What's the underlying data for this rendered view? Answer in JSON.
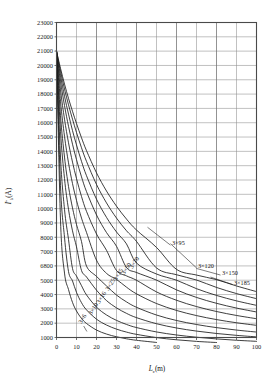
{
  "chart_data": {
    "type": "line",
    "title": "",
    "xlabel": "Lc(m)",
    "xlabel_main": "L",
    "xlabel_sub": "c",
    "xlabel_unit": "(m)",
    "ylabel": "I''k(A)",
    "ylabel_main": "I",
    "ylabel_sub": "k",
    "ylabel_sup": "''",
    "ylabel_unit": "(A)",
    "xlim": [
      0,
      100
    ],
    "ylim": [
      1000,
      23000
    ],
    "grid": true,
    "legend_position": "inline-annotations",
    "xticks": [
      0,
      10,
      20,
      30,
      40,
      50,
      60,
      70,
      80,
      90,
      100
    ],
    "xtick_labels": [
      "0",
      "10",
      "20",
      "30",
      "40",
      "50",
      "60",
      "70",
      "80",
      "90",
      "100"
    ],
    "yticks": [
      1000,
      2000,
      3000,
      4000,
      5000,
      6800,
      7000,
      8000,
      9000,
      10000,
      11000,
      12000,
      13000,
      14000,
      15000,
      16000,
      17000,
      18000,
      19000,
      20000,
      21000,
      22000,
      23000
    ],
    "ytick_labels": [
      "1000",
      "2000",
      "3000",
      "4000",
      "5000",
      "6800",
      "7000",
      "8000",
      "9000",
      "10000",
      "11000",
      "12000",
      "13000",
      "14000",
      "15000",
      "16000",
      "17000",
      "18000",
      "19000",
      "20000",
      "21000",
      "22000",
      "23000"
    ],
    "x": [
      0,
      2,
      4,
      6,
      8,
      10,
      12.5,
      15,
      20,
      25,
      30,
      35,
      40,
      50,
      60,
      70,
      80,
      90,
      100
    ],
    "series": [
      {
        "name": "3×6",
        "label": "3×6",
        "label_x": 12.5,
        "label_y": 1950,
        "label_rotate": -58,
        "values": [
          21000,
          9200,
          5900,
          4350,
          3450,
          2850,
          2330,
          1980,
          1520,
          1240,
          1050,
          910,
          805,
          655,
          552,
          478,
          421,
          377,
          341
        ]
      },
      {
        "name": "3×10",
        "label": "3×10",
        "label_x": 17.5,
        "label_y": 2550,
        "label_rotate": -58,
        "values": [
          21000,
          11600,
          8000,
          6100,
          4950,
          4150,
          3430,
          2930,
          2280,
          1870,
          1585,
          1378,
          1220,
          995,
          840,
          728,
          642,
          575,
          520
        ]
      },
      {
        "name": "3×16",
        "label": "3×16",
        "label_x": 21.5,
        "label_y": 3350,
        "label_rotate": -58,
        "values": [
          21000,
          13600,
          9950,
          7850,
          6480,
          5520,
          4620,
          3975,
          3120,
          2575,
          2195,
          1912,
          1695,
          1388,
          1175,
          1020,
          901,
          808,
          732
        ]
      },
      {
        "name": "3×25",
        "label": "3×25",
        "label_x": 26,
        "label_y": 4250,
        "label_rotate": -58,
        "values": [
          21000,
          15400,
          12100,
          9950,
          8450,
          7330,
          6230,
          5415,
          4305,
          3580,
          3070,
          2685,
          2387,
          1962,
          1665,
          1448,
          1281,
          1150,
          1043
        ]
      },
      {
        "name": "3×35",
        "label": "3×35",
        "label_x": 30,
        "label_y": 4950,
        "label_rotate": -58,
        "values": [
          21000,
          16500,
          13600,
          11550,
          10050,
          8890,
          7700,
          6775,
          5480,
          4600,
          3965,
          3487,
          3110,
          2569,
          2188,
          1907,
          1691,
          1519,
          1380
        ]
      },
      {
        "name": "3×50",
        "label": "3×50",
        "label_x": 34,
        "label_y": 5650,
        "label_rotate": -58,
        "values": [
          21000,
          17500,
          15050,
          13200,
          11750,
          10580,
          9340,
          8340,
          6880,
          5860,
          5100,
          4515,
          4050,
          3372,
          2890,
          2530,
          2252,
          2030,
          1849
        ]
      },
      {
        "name": "3×70",
        "label": "3×70",
        "label_x": 38,
        "label_y": 6400,
        "label_rotate": -58,
        "values": [
          21000,
          18300,
          16250,
          14600,
          13250,
          12100,
          10850,
          9810,
          8230,
          7090,
          6225,
          5545,
          4998,
          4185,
          3601,
          3160,
          2815,
          2539,
          2313
        ]
      },
      {
        "name": "3×95",
        "label": "3×95",
        "label_x": 57,
        "label_y": 7450,
        "label_rotate": 0,
        "values": [
          21000,
          18900,
          17200,
          15750,
          14500,
          13420,
          12220,
          11190,
          9560,
          8330,
          7370,
          6600,
          5970,
          5015,
          4325,
          3800,
          3388,
          3056,
          2783
        ]
      },
      {
        "name": "3×120",
        "label": "3×120",
        "label_x": 70,
        "label_y": 6550,
        "label_rotate": 0,
        "values": [
          21000,
          19300,
          17850,
          16600,
          15450,
          14450,
          13300,
          12300,
          10660,
          9390,
          8370,
          7535,
          6840,
          5780,
          5005,
          4410,
          3939,
          3558,
          3244
        ]
      },
      {
        "name": "3×150",
        "label": "3×150",
        "label_x": 82,
        "label_y": 5650,
        "label_rotate": 0,
        "values": [
          21000,
          19600,
          18350,
          17250,
          16250,
          15320,
          14250,
          13300,
          11690,
          10400,
          9340,
          8455,
          7710,
          6550,
          5690,
          5025,
          4497,
          4068,
          3712
        ]
      },
      {
        "name": "3×185",
        "label": "3×185",
        "label_x": 88,
        "label_y": 4700,
        "label_rotate": 0,
        "values": [
          21000,
          19800,
          18700,
          17700,
          16800,
          15950,
          14950,
          14050,
          12500,
          11230,
          10170,
          9270,
          8505,
          7290,
          6370,
          5650,
          5072,
          4599,
          4204
        ]
      }
    ],
    "annotations": [
      {
        "name": "leader-3x95",
        "from_x": 57,
        "from_y": 7450,
        "to_x": 45.5,
        "to_y": 8700
      },
      {
        "name": "leader-3x120",
        "from_x": 70,
        "from_y": 6550,
        "to_x": 57,
        "to_y": 7550
      },
      {
        "name": "leader-3x150",
        "from_x": 82,
        "from_y": 5650,
        "to_x": 70,
        "to_y": 6480
      },
      {
        "name": "leader-3x185",
        "from_x": 88,
        "from_y": 4700,
        "to_x": 77,
        "to_y": 5400
      },
      {
        "name": "leader-3x6",
        "from_x": 13.6,
        "from_y": 1800,
        "to_x": 15.2,
        "to_y": 1420
      }
    ],
    "colors": {
      "curve": "#1b1b1b",
      "grid": "#8d8d8d",
      "frame": "#4a4a4a",
      "background": "#ffffff",
      "text": "#111111"
    }
  }
}
